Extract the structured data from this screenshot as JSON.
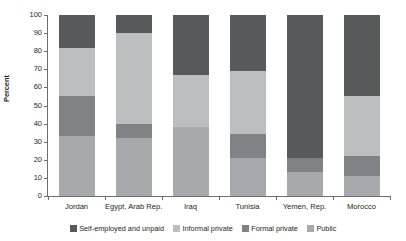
{
  "chart_data": {
    "type": "bar",
    "subtype": "stacked-column-100",
    "title": "",
    "xlabel": "",
    "ylabel": "Percent",
    "ylim": [
      0,
      100
    ],
    "yticks": [
      0,
      10,
      20,
      30,
      40,
      50,
      60,
      70,
      80,
      90,
      100
    ],
    "ytick_labels": [
      "0",
      "10",
      "20",
      "30",
      "40",
      "50",
      "60",
      "70",
      "80",
      "90",
      "100"
    ],
    "grid": false,
    "legend_position": "bottom",
    "categories": [
      "Jordan",
      "Egypt, Arab Rep.",
      "Iraq",
      "Tunisia",
      "Yemen, Rep.",
      "Morocco"
    ],
    "series": [
      {
        "name": "Self-employed and unpaid",
        "color": "#58595b",
        "values": [
          18,
          10,
          33,
          31,
          79,
          45
        ]
      },
      {
        "name": "Informal private",
        "color": "#bcbec0",
        "values": [
          27,
          50,
          29,
          35,
          0,
          33
        ]
      },
      {
        "name": "Formal private",
        "color": "#808285",
        "values": [
          22,
          8,
          0,
          13,
          8,
          11
        ]
      },
      {
        "name": "Public",
        "color": "#a7a9ac",
        "values": [
          33,
          32,
          38,
          21,
          13,
          11
        ]
      }
    ],
    "stack_order_bottom_to_top": [
      "Public",
      "Formal private",
      "Informal private",
      "Self-employed and unpaid"
    ]
  },
  "legend": {
    "items": [
      {
        "label": "Self-employed and unpaid",
        "color": "#58595b"
      },
      {
        "label": "Informal private",
        "color": "#bcbec0"
      },
      {
        "label": "Formal private",
        "color": "#808285"
      },
      {
        "label": "Public",
        "color": "#a7a9ac"
      }
    ]
  }
}
